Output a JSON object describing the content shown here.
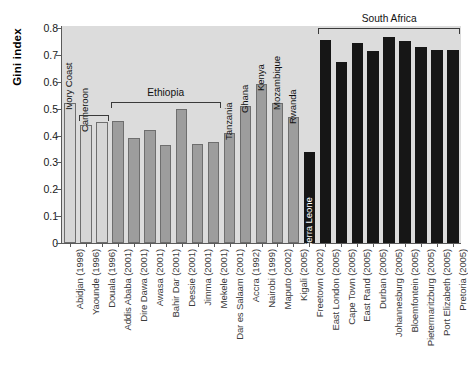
{
  "chart": {
    "type": "bar",
    "ylabel": "Gini index",
    "xlabel": "",
    "title": "",
    "ylim": [
      0,
      0.85
    ],
    "y_ticks": [
      "0",
      "0.1",
      "0.2",
      "0.3",
      "0.4",
      "0.5",
      "0.6",
      "0.7",
      "0.8"
    ],
    "grid": false,
    "legend": "none",
    "colors": {
      "light": "#d6d6d6",
      "mid": "#9d9d9d",
      "dark": "#161616",
      "plot_background": "#dcdcdc",
      "axis": "#5a5a5a"
    }
  },
  "chart_data": {
    "type": "bar",
    "title": "",
    "xlabel": "",
    "ylabel": "Gini index",
    "ylim": [
      0,
      0.85
    ],
    "y_ticks": [
      0,
      0.1,
      0.2,
      0.3,
      0.4,
      0.5,
      0.6,
      0.7,
      0.8
    ],
    "grid": false,
    "legend": "none",
    "categories": [
      "Abidjan (1998)",
      "Yaounde (1996)",
      "Douala (1996)",
      "Addis Ababa (2001)",
      "Dire Dawa (2001)",
      "Awasa (2001)",
      "Bahir Dar (2001)",
      "Dessie (2001)",
      "Jimma (2001)",
      "Mekele (2001)",
      "Dar es Salaam (2001)",
      "Accra (1992)",
      "Nairobi (1999)",
      "Maputo (2002)",
      "Kigali (2005)",
      "Freetown (2002)",
      "East London (2005)",
      "Cape Town (2005)",
      "East Rand (2005)",
      "Durban (2005)",
      "Johannesburg (2005)",
      "Bloemfontein (2005)",
      "Pietermaritzburg (2005)",
      "Port Elizabeth (2005)",
      "Pretoria (2005)"
    ],
    "values": [
      0.52,
      0.44,
      0.45,
      0.455,
      0.39,
      0.42,
      0.365,
      0.5,
      0.37,
      0.375,
      0.41,
      0.51,
      0.59,
      0.52,
      0.468,
      0.34,
      0.755,
      0.675,
      0.745,
      0.715,
      0.765,
      0.75,
      0.73,
      0.72,
      0.72
    ],
    "bars": [
      {
        "label": "Abidjan (1998)",
        "inner": "Ivory Coast",
        "value": 0.52,
        "style": "light",
        "group": "Ivory Coast"
      },
      {
        "label": "Yaounde (1996)",
        "inner": "Cameroon",
        "value": 0.44,
        "style": "light",
        "group": "Cameroon"
      },
      {
        "label": "Douala (1996)",
        "inner": "",
        "value": 0.45,
        "style": "light",
        "group": "Cameroon"
      },
      {
        "label": "Addis Ababa (2001)",
        "inner": "",
        "value": 0.455,
        "style": "mid",
        "group": "Ethiopia"
      },
      {
        "label": "Dire Dawa (2001)",
        "inner": "",
        "value": 0.39,
        "style": "mid",
        "group": "Ethiopia"
      },
      {
        "label": "Awasa (2001)",
        "inner": "",
        "value": 0.42,
        "style": "mid",
        "group": "Ethiopia"
      },
      {
        "label": "Bahir Dar (2001)",
        "inner": "",
        "value": 0.365,
        "style": "mid",
        "group": "Ethiopia"
      },
      {
        "label": "Dessie (2001)",
        "inner": "",
        "value": 0.5,
        "style": "mid",
        "group": "Ethiopia"
      },
      {
        "label": "Jimma (2001)",
        "inner": "",
        "value": 0.37,
        "style": "mid",
        "group": "Ethiopia"
      },
      {
        "label": "Mekele (2001)",
        "inner": "",
        "value": 0.375,
        "style": "mid",
        "group": "Ethiopia"
      },
      {
        "label": "Dar es Salaam (2001)",
        "inner": "Tanzania",
        "value": 0.41,
        "style": "mid",
        "group": "Tanzania"
      },
      {
        "label": "Accra (1992)",
        "inner": "Ghana",
        "value": 0.51,
        "style": "mid",
        "group": "Ghana"
      },
      {
        "label": "Nairobi (1999)",
        "inner": "Kenya",
        "value": 0.59,
        "style": "mid",
        "group": "Kenya"
      },
      {
        "label": "Maputo (2002)",
        "inner": "Mozambique",
        "value": 0.52,
        "style": "mid",
        "group": "Mozambique"
      },
      {
        "label": "Kigali (2005)",
        "inner": "Rwanda",
        "value": 0.468,
        "style": "mid",
        "group": "Rwanda"
      },
      {
        "label": "Freetown (2002)",
        "inner": "Sierra Leone",
        "value": 0.34,
        "style": "dark",
        "group": "Sierra Leone"
      },
      {
        "label": "East London (2005)",
        "inner": "",
        "value": 0.755,
        "style": "dark",
        "group": "South Africa"
      },
      {
        "label": "Cape Town (2005)",
        "inner": "",
        "value": 0.675,
        "style": "dark",
        "group": "South Africa"
      },
      {
        "label": "East Rand (2005)",
        "inner": "",
        "value": 0.745,
        "style": "dark",
        "group": "South Africa"
      },
      {
        "label": "Durban (2005)",
        "inner": "",
        "value": 0.715,
        "style": "dark",
        "group": "South Africa"
      },
      {
        "label": "Johannesburg (2005)",
        "inner": "",
        "value": 0.765,
        "style": "dark",
        "group": "South Africa"
      },
      {
        "label": "Bloemfontein (2005)",
        "inner": "",
        "value": 0.75,
        "style": "dark",
        "group": "South Africa"
      },
      {
        "label": "Pietermaritzburg (2005)",
        "inner": "",
        "value": 0.73,
        "style": "dark",
        "group": "South Africa"
      },
      {
        "label": "Port Elizabeth (2005)",
        "inner": "",
        "value": 0.72,
        "style": "dark",
        "group": "South Africa"
      },
      {
        "label": "Pretoria (2005)",
        "inner": "",
        "value": 0.72,
        "style": "dark",
        "group": "South Africa"
      }
    ],
    "group_brackets": [
      {
        "label": "Ivory Coast",
        "from": 0,
        "to": 0,
        "bracket": false,
        "inline": true
      },
      {
        "label": "Cameroon",
        "from": 1,
        "to": 2,
        "bracket": true,
        "inline": true,
        "y": 0.475
      },
      {
        "label": "Ethiopia",
        "from": 3,
        "to": 9,
        "bracket": true,
        "inline": false,
        "y": 0.525
      },
      {
        "label": "Tanzania",
        "from": 10,
        "to": 10,
        "bracket": false,
        "inline": true
      },
      {
        "label": "Ghana",
        "from": 11,
        "to": 11,
        "bracket": false,
        "inline": true
      },
      {
        "label": "Kenya",
        "from": 12,
        "to": 12,
        "bracket": false,
        "inline": true
      },
      {
        "label": "Mozambique",
        "from": 13,
        "to": 13,
        "bracket": false,
        "inline": true
      },
      {
        "label": "Rwanda",
        "from": 14,
        "to": 14,
        "bracket": false,
        "inline": true
      },
      {
        "label": "Sierra Leone",
        "from": 15,
        "to": 15,
        "bracket": false,
        "inline": true
      },
      {
        "label": "South Africa",
        "from": 16,
        "to": 24,
        "bracket": true,
        "inline": false,
        "y": 0.8
      }
    ]
  }
}
